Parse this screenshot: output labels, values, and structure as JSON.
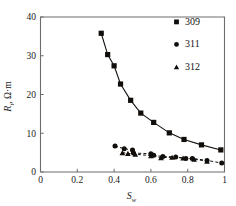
{
  "chart_data": {
    "type": "scatter",
    "title": "",
    "xlabel": "S_w",
    "xlabel_main": "S",
    "xlabel_sub": "w",
    "ylabel": "R_t, Ω·m",
    "ylabel_main": "R",
    "ylabel_sub": "t",
    "ylabel_unit": ", Ω·m",
    "xlim": [
      0,
      1
    ],
    "ylim": [
      0,
      40
    ],
    "xticks": [
      0,
      0.2,
      0.4,
      0.6,
      0.8,
      1
    ],
    "xticklabels": [
      "0",
      "0.2",
      "0.4",
      "0.6",
      "0.8",
      "1"
    ],
    "yticks": [
      0,
      10,
      20,
      30,
      40
    ],
    "yticklabels": [
      "0",
      "10",
      "20",
      "30",
      "40"
    ],
    "grid": false,
    "legend_position": "top-right",
    "series": [
      {
        "name": "309",
        "marker": "square",
        "line": "solid",
        "color": "#100d0a",
        "x": [
          0.33,
          0.365,
          0.4,
          0.435,
          0.49,
          0.545,
          0.615,
          0.7,
          0.78,
          0.875,
          0.98
        ],
        "y": [
          35.8,
          30.3,
          27.4,
          22.7,
          18.5,
          15.2,
          12.8,
          10.1,
          8.4,
          7.0,
          5.7
        ]
      },
      {
        "name": "311",
        "marker": "circle",
        "line": "dashed",
        "color": "#100d0a",
        "x": [
          0.405,
          0.455,
          0.5,
          0.505,
          0.6,
          0.615,
          0.665,
          0.735,
          0.79,
          0.825,
          0.905,
          0.985
        ],
        "y": [
          6.7,
          6.0,
          5.7,
          4.9,
          4.7,
          4.3,
          4.0,
          3.9,
          3.5,
          3.5,
          3.0,
          2.3
        ]
      },
      {
        "name": "312",
        "marker": "triangle",
        "line": "dashed",
        "color": "#100d0a",
        "x": [
          0.445,
          0.475,
          0.515,
          0.6,
          0.655,
          0.715,
          0.775,
          0.835,
          0.905
        ],
        "y": [
          5.0,
          4.8,
          4.6,
          4.2,
          3.7,
          3.8,
          3.6,
          3.3,
          2.8
        ]
      }
    ]
  },
  "legend": {
    "entries": [
      {
        "label": "309",
        "marker": "square"
      },
      {
        "label": "311",
        "marker": "circle"
      },
      {
        "label": "312",
        "marker": "triangle"
      }
    ]
  }
}
